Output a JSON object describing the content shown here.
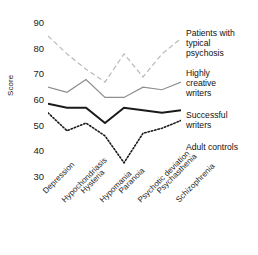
{
  "chart_data": {
    "type": "line",
    "title": "",
    "xlabel": "",
    "ylabel": "Score",
    "ylim": [
      28,
      92
    ],
    "yticks": [
      90,
      80,
      70,
      60,
      50,
      40,
      30
    ],
    "grid": false,
    "legend_position": "right-inline",
    "categories": [
      "Depression",
      "Hypochondriasis",
      "Hysteria",
      "Hypomania",
      "Paranoia",
      "Psychotic deviation",
      "Psychasthenia",
      "Schizophrenia"
    ],
    "series": [
      {
        "name": "Patients with typical psychosis",
        "values": [
          85,
          78,
          72,
          67,
          78,
          69,
          78,
          84
        ],
        "color": "#b8b8b8",
        "style": "dashed",
        "width": 1.2
      },
      {
        "name": "Highly creative writers",
        "values": [
          65,
          63,
          68,
          61,
          61,
          65,
          64,
          67
        ],
        "color": "#8e8e8e",
        "style": "solid",
        "width": 1.2
      },
      {
        "name": "Successful writers",
        "values": [
          58.5,
          57,
          57,
          51,
          57,
          56,
          55,
          56
        ],
        "color": "#1a1a1a",
        "style": "solid",
        "width": 2.0
      },
      {
        "name": "Adult controls",
        "values": [
          55,
          48,
          51,
          46,
          35.5,
          47,
          49,
          52
        ],
        "color": "#1a1a1a",
        "style": "dotted",
        "width": 1.6
      }
    ]
  },
  "legend": {
    "entries": [
      {
        "lines": [
          "Patients with",
          "typical",
          "psychosis"
        ],
        "top": 28
      },
      {
        "lines": [
          "Highly",
          "creative",
          "writers"
        ],
        "top": 68
      },
      {
        "lines": [
          "Successful",
          "writers"
        ],
        "top": 110
      },
      {
        "lines": [
          "Adult controls"
        ],
        "top": 142
      }
    ]
  }
}
